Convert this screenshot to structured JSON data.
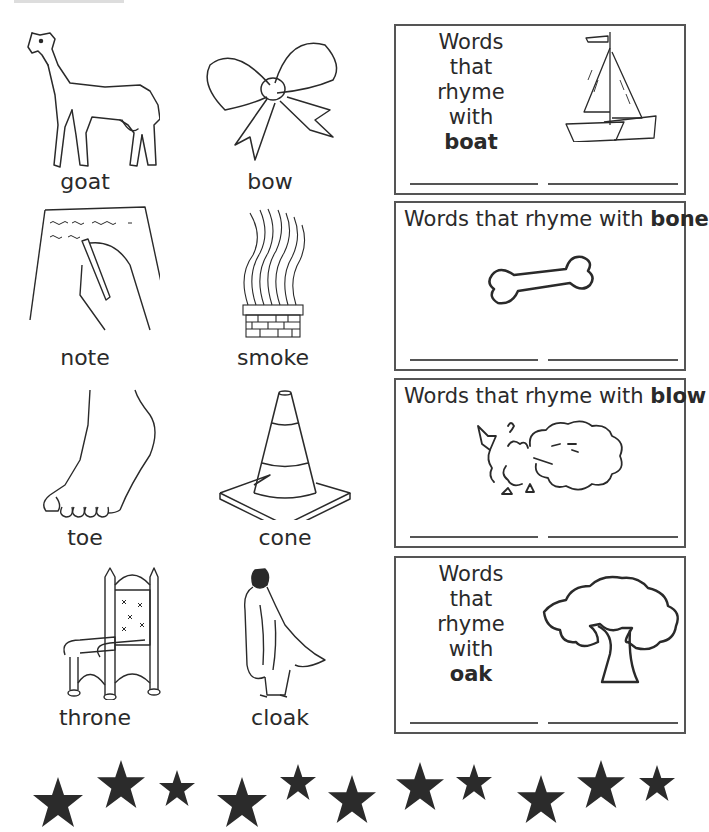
{
  "worksheet": {
    "pictures": [
      {
        "label": "goat",
        "icon": "goat-icon"
      },
      {
        "label": "bow",
        "icon": "bow-icon"
      },
      {
        "label": "note",
        "icon": "note-writing-icon"
      },
      {
        "label": "smoke",
        "icon": "smoke-chimney-icon"
      },
      {
        "label": "toe",
        "icon": "foot-toe-icon"
      },
      {
        "label": "cone",
        "icon": "traffic-cone-icon"
      },
      {
        "label": "throne",
        "icon": "throne-icon"
      },
      {
        "label": "cloak",
        "icon": "cloak-icon"
      }
    ],
    "rhyme_boxes": [
      {
        "prefix_line1": "Words that",
        "prefix_line2": "rhyme with",
        "word": "boat",
        "icon": "sailboat-icon",
        "answer_blanks": [
          "",
          ""
        ]
      },
      {
        "prefix": "Words that rhyme with ",
        "word": "bone",
        "icon": "bone-icon",
        "answer_blanks": [
          "",
          ""
        ]
      },
      {
        "prefix": "Words that rhyme with ",
        "word": "blow",
        "icon": "blowing-cloud-icon",
        "answer_blanks": [
          "",
          ""
        ]
      },
      {
        "prefix_line1": "Words that",
        "prefix_line2": "rhyme with",
        "word": "oak",
        "icon": "oak-tree-icon",
        "answer_blanks": [
          "",
          ""
        ]
      }
    ],
    "star_border": {
      "count": 11,
      "color": "#2b2b2b"
    },
    "colors": {
      "ink": "#2a2a2a",
      "box_border": "#555555",
      "background": "#ffffff"
    }
  }
}
